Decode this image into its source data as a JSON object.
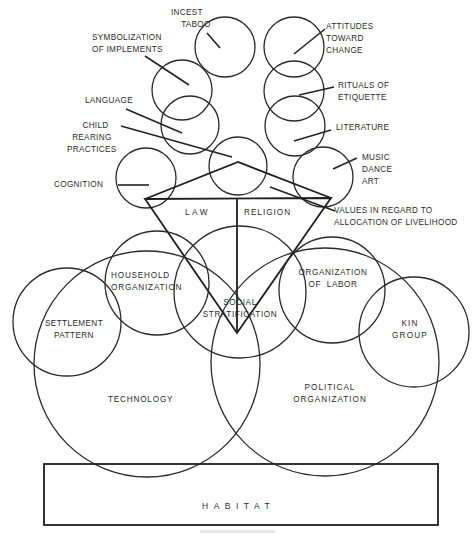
{
  "diagram": {
    "title": "",
    "labels": {
      "incest_taboo": "INCEST\n    TABOO",
      "symbolization": "SYMBOLIZATION\nOF IMPLEMENTS",
      "language": "LANGUAGE",
      "child_rearing": "      CHILD\n  REARING\nPRACTICES",
      "cognition": "COGNITION",
      "attitudes": "ATTITUDES\nTOWARD\nCHANGE",
      "rituals": "RITUALS OF\nETIQUETTE",
      "literature": "LITERATURE",
      "music": "MUSIC\nDANCE\nART",
      "values": "VALUES IN REGARD TO\nALLOCATION OF LIVELIHOOD",
      "law": "LAW",
      "religion": "RELIGION",
      "household": "HOUSEHOLD\nORGANIZATION",
      "social_stratification": "SOCIAL\nSTRATIFICATION",
      "organization_of_labor": "ORGANIZATION\nOF  LABOR",
      "settlement_pattern": "SETTLEMENT\nPATTERN",
      "kin_group": "KIN\nGROUP",
      "technology": "TECHNOLOGY",
      "political_organization": "POLITICAL\nORGANIZATION",
      "habitat": "HABITAT"
    },
    "colors": {
      "stroke": "#2a2a2a",
      "background": "#ffffff",
      "text": "#2b2b2b"
    },
    "nodes": [
      {
        "id": "incest_taboo",
        "shape": "circle",
        "cx": 225,
        "cy": 47,
        "r": 30
      },
      {
        "id": "attitudes",
        "shape": "circle",
        "cx": 294,
        "cy": 47,
        "r": 30
      },
      {
        "id": "symbolization",
        "shape": "circle",
        "cx": 182,
        "cy": 90,
        "r": 30
      },
      {
        "id": "rituals",
        "shape": "circle",
        "cx": 294,
        "cy": 91,
        "r": 30
      },
      {
        "id": "language",
        "shape": "circle",
        "cx": 190,
        "cy": 125,
        "r": 29
      },
      {
        "id": "literature",
        "shape": "circle",
        "cx": 295,
        "cy": 126,
        "r": 30
      },
      {
        "id": "child_rearing",
        "shape": "circle",
        "cx": 238,
        "cy": 166,
        "r": 29
      },
      {
        "id": "cognition",
        "shape": "circle",
        "cx": 146,
        "cy": 178,
        "r": 30
      },
      {
        "id": "music",
        "shape": "circle",
        "cx": 323,
        "cy": 177,
        "r": 30
      },
      {
        "id": "household",
        "shape": "circle",
        "cx": 157,
        "cy": 283,
        "r": 52
      },
      {
        "id": "social_stratification",
        "shape": "circle",
        "cx": 240,
        "cy": 292,
        "r": 66
      },
      {
        "id": "organization_of_labor",
        "shape": "circle",
        "cx": 332,
        "cy": 290,
        "r": 53
      },
      {
        "id": "settlement_pattern",
        "shape": "circle",
        "cx": 67,
        "cy": 322,
        "r": 54
      },
      {
        "id": "kin_group",
        "shape": "circle",
        "cx": 414,
        "cy": 332,
        "r": 55
      },
      {
        "id": "technology",
        "shape": "circle",
        "cx": 147,
        "cy": 364,
        "r": 113
      },
      {
        "id": "political_organization",
        "shape": "circle",
        "cx": 325,
        "cy": 362,
        "r": 114
      },
      {
        "id": "habitat",
        "shape": "rect",
        "x": 44,
        "y": 464,
        "w": 394,
        "h": 61
      }
    ]
  }
}
